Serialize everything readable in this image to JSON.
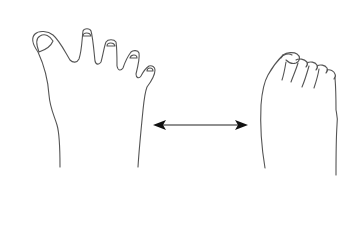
{
  "diagram": {
    "type": "illustration",
    "elements": [
      {
        "id": "left-foot",
        "label": "Splayed toes foot",
        "toes": 5,
        "toe_spread": "wide"
      },
      {
        "id": "double-arrow",
        "label": "Bidirectional arrow",
        "direction": "left-right"
      },
      {
        "id": "right-foot",
        "label": "Compressed toes foot",
        "toes": 5,
        "toe_spread": "narrow"
      }
    ]
  },
  "colors": {
    "background": "#ffffff",
    "outline": "#555555",
    "arrow": "#111111"
  }
}
